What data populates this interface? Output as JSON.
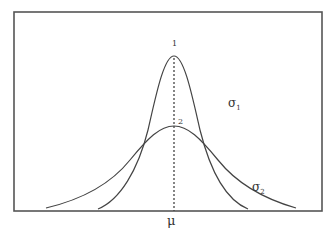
{
  "diagram": {
    "title": "",
    "curves": [
      {
        "id": "curve-1",
        "peak_label": "1",
        "sigma_label": "σ",
        "sigma_sub": "1",
        "kind": "narrow"
      },
      {
        "id": "curve-2",
        "peak_label": "2",
        "sigma_label": "σ",
        "sigma_sub": "2",
        "kind": "wide"
      }
    ],
    "mean_label": "μ",
    "colors": {
      "line": "#444444",
      "frame": "#555555",
      "background": "#ffffff"
    }
  }
}
